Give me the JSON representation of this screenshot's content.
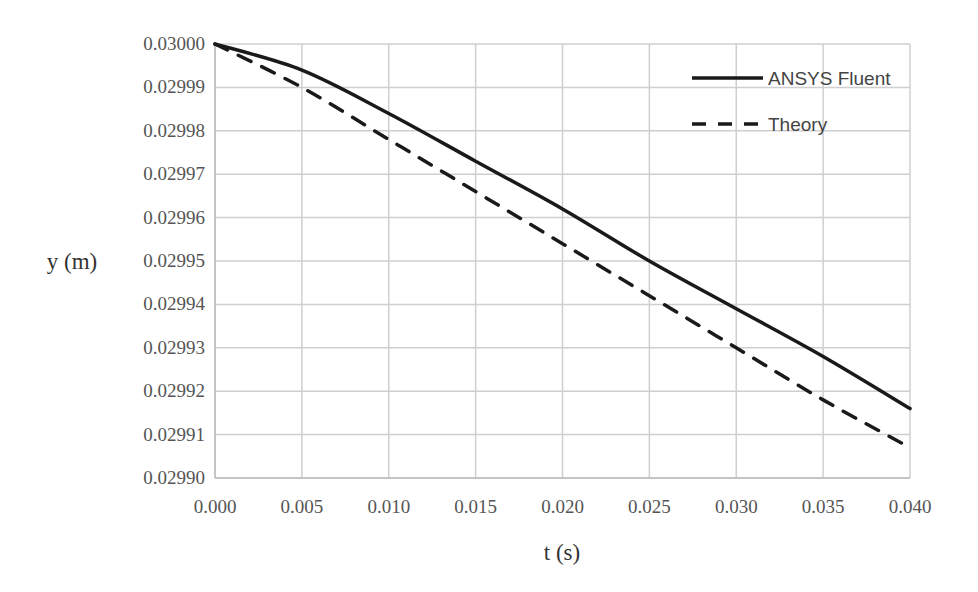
{
  "chart_data": {
    "type": "line",
    "title": "",
    "xlabel": "t (s)",
    "ylabel": "y (m)",
    "xlim": [
      0.0,
      0.04
    ],
    "ylim": [
      0.0299,
      0.03
    ],
    "x_ticks": [
      "0.000",
      "0.005",
      "0.010",
      "0.015",
      "0.020",
      "0.025",
      "0.030",
      "0.035",
      "0.040"
    ],
    "y_ticks": [
      "0.02990",
      "0.02991",
      "0.02992",
      "0.02993",
      "0.02994",
      "0.02995",
      "0.02996",
      "0.02997",
      "0.02998",
      "0.02999",
      "0.03000"
    ],
    "grid": true,
    "legend_position": "upper right",
    "x": [
      0.0,
      0.005,
      0.01,
      0.015,
      0.02,
      0.025,
      0.03,
      0.035,
      0.04
    ],
    "series": [
      {
        "name": "ANSYS Fluent",
        "style": "solid",
        "color": "#1a1a1a",
        "values": [
          0.03,
          0.029994,
          0.029984,
          0.029973,
          0.029962,
          0.02995,
          0.029939,
          0.029928,
          0.029916
        ]
      },
      {
        "name": "Theory",
        "style": "dashed",
        "color": "#1a1a1a",
        "values": [
          0.03,
          0.02999,
          0.029978,
          0.029966,
          0.029954,
          0.029942,
          0.02993,
          0.029918,
          0.029907
        ]
      }
    ]
  }
}
